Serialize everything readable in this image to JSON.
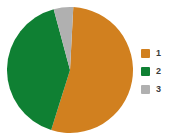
{
  "chart_data": {
    "type": "pie",
    "title": "",
    "categories": [
      "1",
      "2",
      "3"
    ],
    "values": [
      54,
      41,
      5
    ],
    "unit": "%",
    "colors": [
      "#d1801f",
      "#0f8033",
      "#b0b0b0"
    ],
    "start_angle_deg": 3,
    "direction": "clockwise",
    "legend_position": "right",
    "grid": false,
    "xlabel": "",
    "ylabel": "",
    "series": [
      {
        "name": "1",
        "value": 54,
        "color": "#d1801f"
      },
      {
        "name": "2",
        "value": 41,
        "color": "#0f8033"
      },
      {
        "name": "3",
        "value": 5,
        "color": "#b0b0b0"
      }
    ]
  },
  "legend": {
    "items": [
      {
        "label": "1",
        "color": "#d1801f",
        "swatch_icon": "square-swatch-icon"
      },
      {
        "label": "2",
        "color": "#0f8033",
        "swatch_icon": "square-swatch-icon"
      },
      {
        "label": "3",
        "color": "#b0b0b0",
        "swatch_icon": "square-swatch-icon"
      }
    ]
  },
  "header": {
    "clipped_title": ""
  },
  "geometry": {
    "center_x": 63,
    "center_y": 64,
    "radius": 63
  }
}
